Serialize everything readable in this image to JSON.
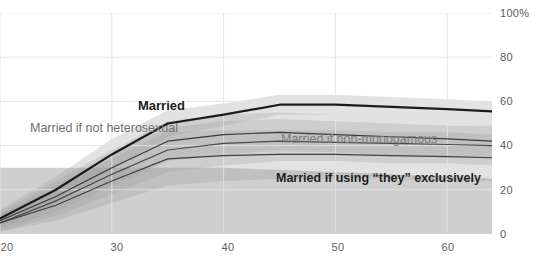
{
  "chart_data": {
    "type": "line",
    "title": "",
    "xlabel": "",
    "ylabel": "",
    "xlim": [
      20,
      64
    ],
    "ylim": [
      0,
      100
    ],
    "grid": true,
    "legend_position": "inline-annotations",
    "y_ticks": [
      "0",
      "20",
      "40",
      "60",
      "80",
      "100%"
    ],
    "y_tick_values": [
      0,
      20,
      40,
      60,
      80,
      100
    ],
    "x_ticks": [
      "20",
      "30",
      "40",
      "50",
      "60"
    ],
    "x_tick_values": [
      20,
      30,
      40,
      50,
      60
    ],
    "series": [
      {
        "name": "Married",
        "label": "Married",
        "color": "#1b1b1b",
        "x": [
          20,
          25,
          30,
          35,
          40,
          45,
          50,
          55,
          60,
          64
        ],
        "values": [
          7,
          20,
          36,
          50,
          54,
          58.5,
          58.5,
          57.5,
          56.5,
          55.5
        ],
        "band_low": [
          3,
          14,
          29,
          44,
          49,
          54,
          54,
          53,
          52,
          51
        ],
        "band_high": [
          11,
          26,
          43,
          56,
          59,
          63,
          63,
          62,
          61,
          60
        ]
      },
      {
        "name": "Married if not heterosexual",
        "label": "Married if not heterosexual",
        "color": "#3a3a3a",
        "x": [
          20,
          25,
          30,
          35,
          40,
          45,
          50,
          55,
          60,
          64
        ],
        "values": [
          6,
          17,
          30,
          42,
          45,
          46,
          45,
          44,
          43,
          42
        ],
        "band_low": [
          2,
          10,
          22,
          33,
          36,
          38,
          37,
          36,
          35,
          34
        ],
        "band_high": [
          10,
          24,
          38,
          51,
          54,
          55,
          54,
          53,
          52,
          51
        ]
      },
      {
        "name": "Married if non-monogamous",
        "label": "Married if non-monogamous",
        "color": "#4a4a4a",
        "x": [
          20,
          25,
          30,
          35,
          40,
          45,
          50,
          55,
          60,
          64
        ],
        "values": [
          5,
          15,
          27,
          38,
          41,
          42,
          41.5,
          41,
          40.5,
          40
        ],
        "band_low": [
          1,
          8,
          18,
          28,
          31,
          33,
          33,
          32,
          32,
          31
        ],
        "band_high": [
          9,
          22,
          36,
          48,
          51,
          52,
          51,
          50,
          49,
          49
        ]
      },
      {
        "name": "Married if using \"they\" exclusively",
        "label": "Married if using \"they\" exclusively",
        "color": "#3f3f3f",
        "x": [
          20,
          25,
          30,
          35,
          40,
          45,
          50,
          55,
          60,
          64
        ],
        "values": [
          5,
          13,
          24,
          34,
          35.5,
          36,
          36,
          35.5,
          35,
          34.5
        ],
        "band_low": [
          1,
          6,
          14,
          22,
          24,
          25,
          25,
          25,
          24,
          24
        ],
        "band_high": [
          9,
          20,
          34,
          46,
          47,
          47,
          47,
          46,
          46,
          45
        ]
      }
    ],
    "background_band": {
      "name": "outer-uncertainty-band",
      "x": [
        20,
        25,
        30,
        35,
        40,
        45,
        50,
        55,
        60,
        64
      ],
      "low": [
        0,
        0,
        0,
        0,
        0,
        0,
        0,
        0,
        0,
        0
      ],
      "high": [
        30,
        30,
        30,
        30,
        30,
        29,
        28,
        27,
        26,
        25
      ]
    }
  },
  "annotations": [
    {
      "id": "label-married",
      "text": "Married",
      "style": "strong",
      "left": 138,
      "top": 99
    },
    {
      "id": "label-not-heterosexual",
      "text": "Married if not heterosexual",
      "style": "muted",
      "left": 30,
      "top": 122
    },
    {
      "id": "label-non-monogamous",
      "text": "Married if non-monogamous",
      "style": "mid",
      "left": 281,
      "top": 133
    },
    {
      "id": "label-they-exclusively",
      "text": "Married if using “they” exclusively",
      "style": "dark",
      "left": 276,
      "top": 172
    }
  ],
  "colors": {
    "axis_text": "#5d5d5d",
    "gridline": "#e3e3e3",
    "band_light": "#e8e8e8",
    "band_mid": "#c9c9c9",
    "band_dark": "#a8a8a8",
    "line_primary": "#1b1b1b",
    "background": "#ffffff"
  }
}
